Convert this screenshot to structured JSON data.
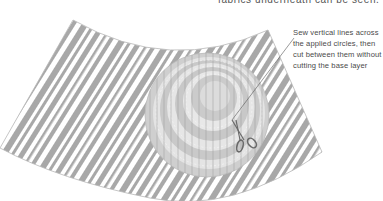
{
  "diagram": {
    "caption_top": "fabrics underneath can be seen.",
    "annotation": {
      "lines": [
        "Sew vertical lines across",
        "the applied circles, then",
        "cut between them without",
        "cutting the base layer"
      ]
    },
    "elements": {
      "base_fabric": "striped fan-shaped base layer",
      "applied_circles": "concentric applied circles with vertical stitch lines",
      "tool": "scissors-icon"
    },
    "colors": {
      "stripe": "#a8a8a8",
      "background": "#ffffff",
      "circle_dark": "#c4c4c4",
      "circle_light": "#e2e2e2",
      "outline": "#b0b0b0",
      "leader_line": "#555555",
      "text": "#4a4a4a"
    }
  }
}
